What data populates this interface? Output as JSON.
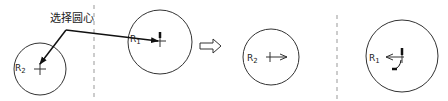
{
  "annotation": {
    "text": "选择圆心"
  },
  "left_panel": {
    "circle_r2": {
      "label": "R",
      "sub": "2"
    },
    "circle_r1": {
      "label": "R",
      "sub": "1"
    }
  },
  "transition": {
    "arrow": "hollow-right-arrow"
  },
  "right_panel": {
    "circle_r2": {
      "label": "R",
      "sub": "2"
    },
    "circle_r1": {
      "label": "R",
      "sub": "1"
    }
  },
  "colors": {
    "stroke": "#333333",
    "divider": "#999999"
  }
}
